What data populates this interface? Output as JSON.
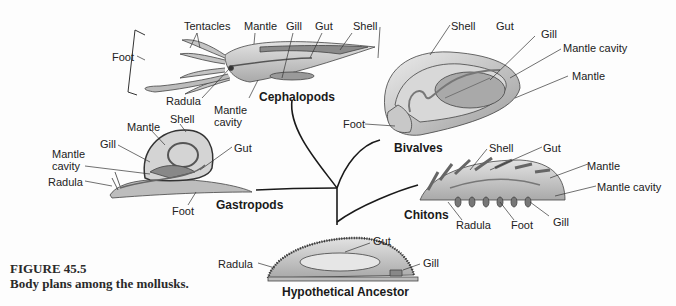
{
  "figure": {
    "number": "FIGURE 45.5",
    "caption": "Body plans among the mollusks."
  },
  "groups": {
    "cephalopods": {
      "name": "Cephalopods",
      "labels": {
        "foot": "Foot",
        "tentacles": "Tentacles",
        "mantle": "Mantle",
        "gill": "Gill",
        "gut": "Gut",
        "shell": "Shell",
        "radula": "Radula",
        "mantle_cavity_1": "Mantle",
        "mantle_cavity_2": "cavity"
      }
    },
    "bivalves": {
      "name": "Bivalves",
      "labels": {
        "shell": "Shell",
        "gut": "Gut",
        "gill": "Gill",
        "mantle_cavity": "Mantle cavity",
        "mantle": "Mantle",
        "foot": "Foot"
      }
    },
    "gastropods": {
      "name": "Gastropods",
      "labels": {
        "shell": "Shell",
        "mantle": "Mantle",
        "gill": "Gill",
        "mantle_cavity_1": "Mantle",
        "mantle_cavity_2": "cavity",
        "gut": "Gut",
        "radula": "Radula",
        "foot": "Foot"
      }
    },
    "chitons": {
      "name": "Chitons",
      "labels": {
        "shell": "Shell",
        "gut": "Gut",
        "mantle": "Mantle",
        "mantle_cavity": "Mantle cavity",
        "radula": "Radula",
        "foot": "Foot",
        "gill": "Gill"
      }
    },
    "ancestor": {
      "name": "Hypothetical Ancestor",
      "labels": {
        "radula": "Radula",
        "gut": "Gut",
        "gill": "Gill"
      }
    }
  },
  "colors": {
    "body_fill": "#c9c9c9",
    "body_dark": "#8a8a8a",
    "outline": "#444444",
    "branch": "#1a1a1a",
    "background": "#fdfdfd"
  }
}
